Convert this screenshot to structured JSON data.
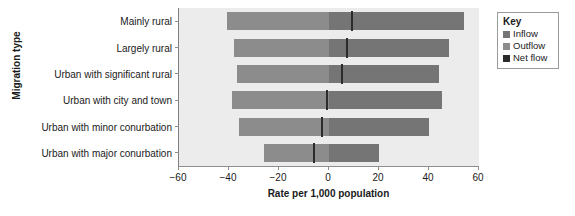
{
  "chart_data": {
    "type": "bar",
    "orientation": "horizontal",
    "title": "",
    "xlabel": "Rate per 1,000 population",
    "ylabel": "Migration type",
    "xlim": [
      -60,
      60
    ],
    "xticks": [
      -60,
      -40,
      -20,
      0,
      20,
      40,
      60
    ],
    "xtick_labels": [
      "−60",
      "−40",
      "−20",
      "0",
      "20",
      "40",
      "60"
    ],
    "grid": false,
    "legend_position": "right",
    "categories": [
      "Mainly rural",
      "Largely rural",
      "Urban with significant rural",
      "Urban with city and town",
      "Urban with minor conurbation",
      "Urban with major conurbation"
    ],
    "series": [
      {
        "name": "Inflow",
        "color": "#757575",
        "values": [
          54,
          48,
          44,
          45,
          40,
          20
        ]
      },
      {
        "name": "Outflow",
        "color": "#8c8c8c",
        "values": [
          -41,
          -38,
          -37,
          -39,
          -36,
          -26
        ]
      },
      {
        "name": "Net flow",
        "color": "#2b2b2b",
        "values": [
          9,
          7,
          5,
          -1,
          -3,
          -6
        ]
      }
    ]
  },
  "axes": {
    "y_title": "Migration type",
    "x_title": "Rate per 1,000 population"
  },
  "legend": {
    "title": "Key",
    "items": [
      {
        "label": "Inflow",
        "color": "#757575"
      },
      {
        "label": "Outflow",
        "color": "#8c8c8c"
      },
      {
        "label": "Net flow",
        "color": "#2b2b2b"
      }
    ]
  }
}
